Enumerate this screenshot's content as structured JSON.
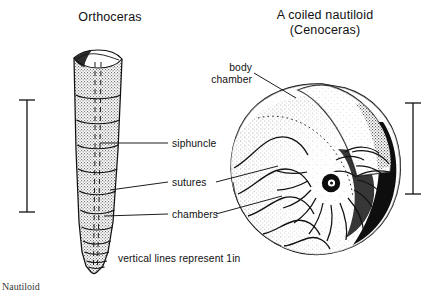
{
  "figure": {
    "kind": "scientific-illustration",
    "style": "black and white stippled line drawing"
  },
  "titles": {
    "left_specimen": "Orthoceras",
    "right_specimen_line1": "A coiled nautiloid",
    "right_specimen_line2": "(Cenoceras)"
  },
  "labels": {
    "siphuncle": "siphuncle",
    "sutures": "sutures",
    "chambers": "chambers",
    "body_chamber": "body\nchamber",
    "body_chamber_line1": "body",
    "body_chamber_line2": "chamber"
  },
  "caption": {
    "scale_note": "vertical lines represent 1in"
  },
  "footer": {
    "cut_off_text": "Nautiloid"
  },
  "scale_bars": {
    "left": {
      "label": "1in",
      "x": 27,
      "top": 100,
      "bottom": 212
    },
    "right": {
      "label": "1in",
      "x": 413,
      "top": 103,
      "bottom": 194
    }
  },
  "colors": {
    "ink": "#111111",
    "paper": "#ffffff",
    "stipple": "#2a2a2a",
    "faint": "#6f6f6f"
  }
}
